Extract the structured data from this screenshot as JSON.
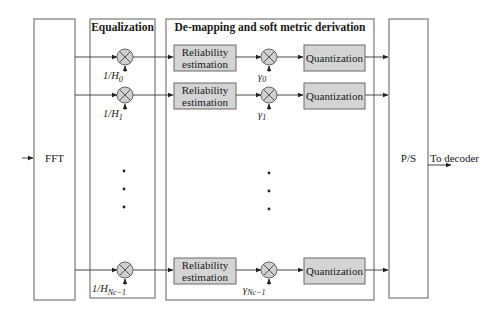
{
  "diagram": {
    "input_block": {
      "label": "FFT"
    },
    "equalization": {
      "title": "Equalization",
      "coefficients": [
        "1/H",
        "1/H",
        "1/H"
      ],
      "coefficient_subscripts": [
        "0",
        "1",
        "Nc−1"
      ]
    },
    "demapping": {
      "title": "De-mapping and soft metric derivation",
      "reliability_label_line1": "Reliability",
      "reliability_label_line2": "estimation",
      "quantization_label": "Quantization",
      "gamma_symbol": "γ",
      "gamma_subscripts": [
        "0",
        "1",
        "Nc−1"
      ]
    },
    "output_block": {
      "label": "P/S"
    },
    "output_label": "To decoder",
    "ellipsis": "⋮"
  }
}
